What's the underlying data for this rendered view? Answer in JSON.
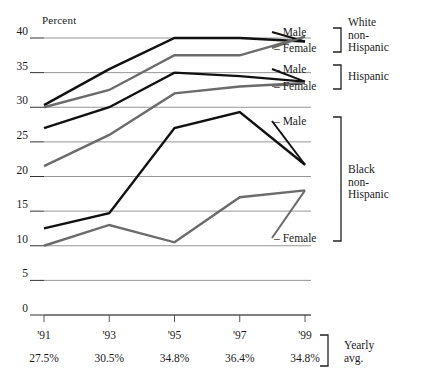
{
  "chart_data": {
    "type": "line",
    "title": "",
    "ylabel": "Percent",
    "xlabel": "",
    "ylim": [
      0,
      40
    ],
    "yticks": [
      0,
      5,
      10,
      15,
      20,
      25,
      30,
      35,
      40
    ],
    "ytick_labels": [
      "0",
      "5",
      "10",
      "15",
      "20",
      "25",
      "30",
      "35",
      "40"
    ],
    "grid": true,
    "legend_position": "right",
    "categories": [
      "'91",
      "'93",
      "'95",
      "'97",
      "'99"
    ],
    "x": [
      1991,
      1993,
      1995,
      1997,
      1999
    ],
    "series": [
      {
        "name": "White non-Hispanic Male",
        "group": "White non-Hispanic",
        "sex": "Male",
        "color": "#111111",
        "values": [
          30.3,
          35.5,
          40.0,
          40.0,
          39.5
        ]
      },
      {
        "name": "White non-Hispanic Female",
        "group": "White non-Hispanic",
        "sex": "Female",
        "color": "#6b6b6b",
        "values": [
          30.0,
          32.5,
          37.5,
          37.5,
          40.2
        ]
      },
      {
        "name": "Hispanic Male",
        "group": "Hispanic",
        "sex": "Male",
        "color": "#111111",
        "values": [
          27.0,
          30.0,
          35.0,
          34.5,
          33.7
        ]
      },
      {
        "name": "Hispanic Female",
        "group": "Hispanic",
        "sex": "Female",
        "color": "#6b6b6b",
        "values": [
          21.5,
          26.0,
          32.0,
          33.0,
          33.5
        ]
      },
      {
        "name": "Black non-Hispanic Male",
        "group": "Black non-Hispanic",
        "sex": "Male",
        "color": "#111111",
        "values": [
          12.5,
          14.7,
          27.0,
          29.3,
          21.7
        ]
      },
      {
        "name": "Black non-Hispanic Female",
        "group": "Black non-Hispanic",
        "sex": "Female",
        "color": "#6b6b6b",
        "values": [
          10.0,
          13.0,
          10.5,
          17.0,
          18.0
        ]
      }
    ],
    "annotations": {
      "yearly_avg_caption": "Yearly avg.",
      "yearly_avg_values": [
        "27.5%",
        "30.5%",
        "34.8%",
        "36.4%",
        "34.8%"
      ]
    }
  },
  "axes": {
    "y_title": "Percent",
    "y_labels": [
      "40",
      "35",
      "30",
      "25",
      "20",
      "15",
      "10",
      "5",
      "0"
    ],
    "x_labels": [
      "'91",
      "'93",
      "'95",
      "'97",
      "'99"
    ]
  },
  "averages": {
    "values": [
      "27.5%",
      "30.5%",
      "34.8%",
      "36.4%",
      "34.8%"
    ],
    "caption_line1": "Yearly",
    "caption_line2": "avg."
  },
  "legend": {
    "white": {
      "male": "– Male",
      "female": "– Female",
      "group_line1": "White",
      "group_line2": "non-",
      "group_line3": "Hispanic"
    },
    "hispanic": {
      "male": "– Male",
      "female": "– Female",
      "group_line1": "Hispanic"
    },
    "black": {
      "male": "– Male",
      "female": "– Female",
      "group_line1": "Black",
      "group_line2": "non-",
      "group_line3": "Hispanic"
    }
  }
}
